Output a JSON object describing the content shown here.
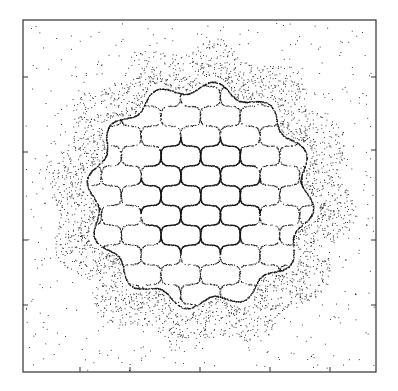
{
  "chart_data": {
    "type": "scatter",
    "title": "",
    "xlabel": "",
    "ylabel": "",
    "frame": {
      "x0": 23,
      "y0": 20,
      "x1": 376,
      "y1": 372
    },
    "center": {
      "x": 200,
      "y": 195
    },
    "lattice": {
      "cell": 28,
      "rotation_deg": 45,
      "core_radius": 62,
      "web_radius": 108
    },
    "annulus": {
      "inner": 112,
      "outer": 150
    },
    "left_ticks_y": [
      77,
      152,
      240,
      305
    ],
    "bottom_ticks_x": [
      80,
      130,
      200,
      270,
      330
    ],
    "right_ticks_y": [
      77,
      150,
      240,
      305
    ],
    "grid": false,
    "legend": null,
    "colors": {
      "ink": "#111111",
      "frame": "#333333",
      "background": "#ffffff"
    }
  }
}
